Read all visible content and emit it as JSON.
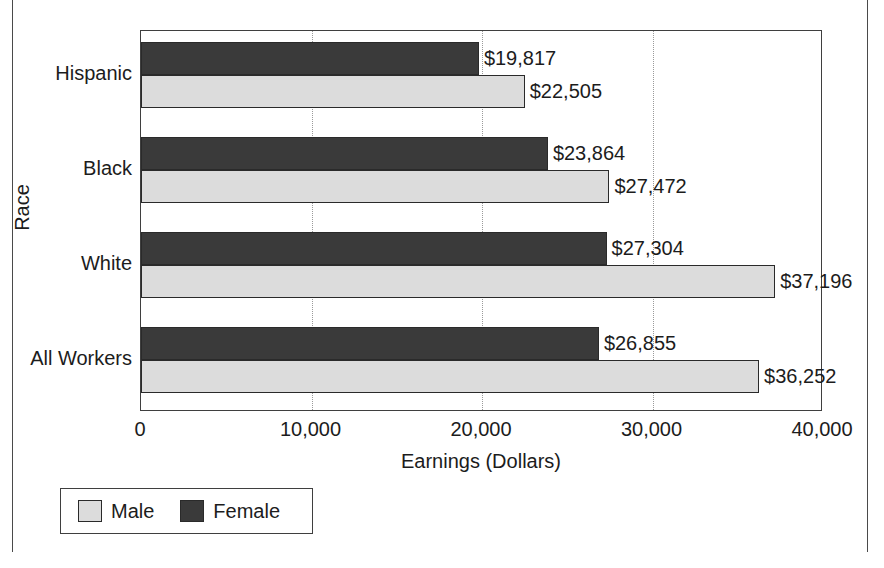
{
  "figure": {
    "clipped_title_fragment": "",
    "outer_frame": true
  },
  "chart_data": {
    "type": "bar",
    "orientation": "horizontal",
    "title": "",
    "xlabel": "Earnings (Dollars)",
    "ylabel": "Race",
    "categories": [
      "Hispanic",
      "Black",
      "White",
      "All Workers"
    ],
    "series": [
      {
        "name": "Male",
        "color": "#dcdcdc",
        "values": [
          22505,
          27472,
          37196,
          36252
        ],
        "labels": [
          "$22,505",
          "$27,472",
          "$37,196",
          "$36,252"
        ]
      },
      {
        "name": "Female",
        "color": "#3a3a3a",
        "values": [
          19817,
          23864,
          27304,
          26855
        ],
        "labels": [
          "$19,817",
          "$23,864",
          "$27,304",
          "$26,855"
        ]
      }
    ],
    "xlim": [
      0,
      40000
    ],
    "xticks": [
      0,
      10000,
      20000,
      30000,
      40000
    ],
    "xtick_labels": [
      "0",
      "10,000",
      "20,000",
      "30,000",
      "40,000"
    ],
    "grid": "vertical-dotted",
    "legend_position": "below-left",
    "legend_entries": [
      "Male",
      "Female"
    ]
  }
}
